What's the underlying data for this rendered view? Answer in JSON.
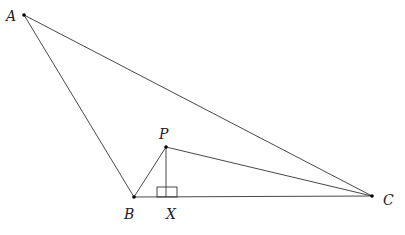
{
  "diagram": {
    "points": {
      "A": {
        "label": "A",
        "x": 24,
        "y": 15,
        "lx": 6,
        "ly": 20
      },
      "B": {
        "label": "B",
        "x": 134,
        "y": 197,
        "lx": 124,
        "ly": 218
      },
      "C": {
        "label": "C",
        "x": 372,
        "y": 196,
        "lx": 383,
        "ly": 205
      },
      "P": {
        "label": "P",
        "x": 166,
        "y": 147,
        "lx": 159,
        "ly": 139
      },
      "X": {
        "label": "X",
        "x": 166,
        "y": 197,
        "lx": 166,
        "ly": 218
      }
    },
    "segments": [
      [
        "A",
        "B"
      ],
      [
        "A",
        "C"
      ],
      [
        "B",
        "C"
      ],
      [
        "B",
        "P"
      ],
      [
        "P",
        "C"
      ],
      [
        "P",
        "X"
      ]
    ],
    "right_angle": {
      "at": "X",
      "size": 10
    }
  }
}
